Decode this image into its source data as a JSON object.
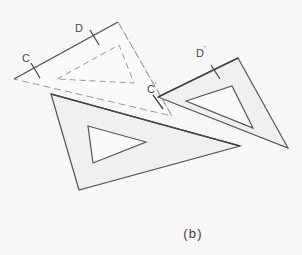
{
  "figure": {
    "caption": "(b)",
    "colors": {
      "background": "#f8f7f5",
      "fill_light": "#f1f0ee",
      "stroke_dark": "#4d4d4d",
      "stroke_mid": "#6f6f6f",
      "stroke_faint": "#9a9a9a",
      "label": "#4a4a4a"
    },
    "labels": [
      {
        "id": "label-c",
        "text": "C",
        "prime": "",
        "x": 22,
        "y": 62,
        "tick_at": "ghost-hypotenuse-left"
      },
      {
        "id": "label-d",
        "text": "D",
        "prime": "",
        "x": 75,
        "y": 32,
        "tick_at": "ghost-hypotenuse-right"
      },
      {
        "id": "label-c-prime",
        "text": "C",
        "prime": "'",
        "x": 147,
        "y": 93,
        "tick_at": "moved-hypotenuse-left"
      },
      {
        "id": "label-d-prime",
        "text": "D",
        "prime": "'",
        "x": 196,
        "y": 57,
        "tick_at": "moved-hypotenuse-right"
      }
    ],
    "shapes": [
      {
        "id": "ghost-triangle",
        "name": "ghost-set-square-upper-left",
        "style": "dashed-outline",
        "outer": "14,79 118,22 172,116",
        "inner": "57,79 119,45 134,83"
      },
      {
        "id": "lower-triangle",
        "name": "filled-set-square-lower-left",
        "style": "filled",
        "outer": "51,94 240,146 79,190",
        "inner": "88,126 146,142 93,163"
      },
      {
        "id": "right-triangle",
        "name": "filled-set-square-right",
        "style": "filled",
        "outer": "158,97 238,58 288,148",
        "inner": "186,101 232,86 253,128"
      }
    ]
  }
}
